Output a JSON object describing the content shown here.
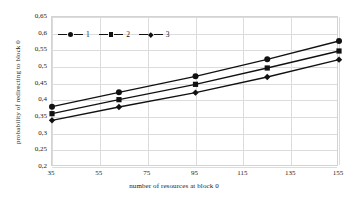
{
  "chart_data": {
    "type": "line",
    "title": "",
    "xlabel": "number of resources at block 0",
    "ylabel": "probability of redirecting to block 0",
    "x": [
      35,
      63,
      95,
      125,
      155
    ],
    "xlim": [
      35,
      155
    ],
    "ylim": [
      0.2,
      0.65
    ],
    "xticks": [
      "35",
      "55",
      "75",
      "95",
      "115",
      "135",
      "155"
    ],
    "xtick_values": [
      35,
      55,
      75,
      95,
      115,
      135,
      155
    ],
    "yticks": [
      "0,2",
      "0,25",
      "0,3",
      "0,35",
      "0,4",
      "0,45",
      "0,5",
      "0,55",
      "0,6",
      "0,65"
    ],
    "ytick_values": [
      0.2,
      0.25,
      0.3,
      0.35,
      0.4,
      0.45,
      0.5,
      0.55,
      0.6,
      0.65
    ],
    "grid": true,
    "legend_position": "top-left-inside",
    "decimal_separator": ",",
    "series": [
      {
        "name": "1",
        "marker": "circle",
        "color": "#111111",
        "values": [
          0.381,
          0.424,
          0.472,
          0.523,
          0.578
        ]
      },
      {
        "name": "2",
        "marker": "square",
        "color": "#111111",
        "values": [
          0.36,
          0.402,
          0.448,
          0.497,
          0.548
        ]
      },
      {
        "name": "3",
        "marker": "diamond",
        "color": "#111111",
        "values": [
          0.34,
          0.38,
          0.423,
          0.47,
          0.522
        ]
      }
    ]
  },
  "legend": {
    "items": [
      {
        "label": "1",
        "marker": "circle-marker-icon"
      },
      {
        "label": "2",
        "marker": "square-marker-icon"
      },
      {
        "label": "3",
        "marker": "diamond-marker-icon"
      }
    ]
  },
  "colors": {
    "series": "#111111",
    "grid": "#dcdcdc",
    "frame": "#d3d3d3",
    "text": "#1a1a1a",
    "background": "#ffffff"
  }
}
